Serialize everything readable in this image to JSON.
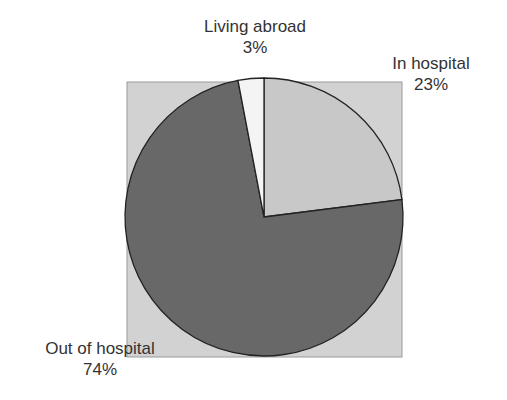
{
  "chart_data": {
    "type": "pie",
    "title": "",
    "slices": [
      {
        "label": "In hospital",
        "value": 23,
        "display": "23%",
        "color": "#c8c8c8"
      },
      {
        "label": "Out of hospital",
        "value": 74,
        "display": "74%",
        "color": "#686868"
      },
      {
        "label": "Living abroad",
        "value": 3,
        "display": "3%",
        "color": "#f4f4f4"
      }
    ],
    "background_color": "#d2d2d2",
    "start_angle_deg": 0,
    "direction": "clockwise",
    "legend": "none (direct labels)"
  },
  "labels": {
    "living_abroad": {
      "name": "Living abroad",
      "pct": "3%"
    },
    "in_hospital": {
      "name": "In hospital",
      "pct": "23%"
    },
    "out_of_hospital": {
      "name": "Out of hospital",
      "pct": "74%"
    }
  }
}
